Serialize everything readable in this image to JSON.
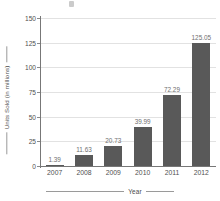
{
  "chart_data": {
    "type": "bar",
    "title": "",
    "categories": [
      "2007",
      "2008",
      "2009",
      "2010",
      "2011",
      "2012"
    ],
    "values": [
      1.39,
      11.63,
      20.73,
      39.99,
      72.29,
      125.05
    ],
    "value_labels": [
      "1.39",
      "11.63",
      "20.73",
      "39.99",
      "72.29",
      "125.05"
    ],
    "xlabel": "Year",
    "ylabel": "Units Sold (in millions)",
    "ylim": [
      0,
      150
    ],
    "yticks": [
      0,
      25,
      50,
      75,
      100,
      125,
      150
    ],
    "ytick_labels": [
      "0",
      "25",
      "50",
      "75",
      "100",
      "125",
      "150"
    ],
    "grid": true,
    "legend": false,
    "colors": {
      "bar": "#595959",
      "gridline": "#e2e2e2",
      "axis": "#777777",
      "tick_text": "#4f4f4f",
      "value_text": "#6f6f6f",
      "axis_title_text": "#4a4a4a",
      "background": "#ffffff"
    }
  }
}
